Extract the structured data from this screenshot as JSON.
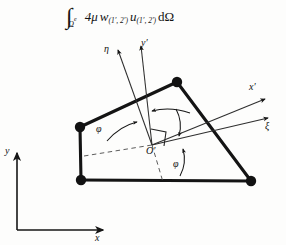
{
  "figure": {
    "formula": {
      "integral_symbol": "∫",
      "integral_subscript": "Ω",
      "integral_superscript": "e",
      "coefficient": "4μ",
      "weight_symbol": "w",
      "weight_subscript": "(1′, 2′)",
      "field_symbol": "u",
      "field_subscript": "(1′, 2′)",
      "measure": "dΩ"
    },
    "global_axes": {
      "x_label": "x",
      "y_label": "y"
    },
    "local_axes": {
      "eta_label": "η",
      "y_prime_label": "y′",
      "x_prime_label": "x′",
      "xi_label": "ξ"
    },
    "origin_label": "O′",
    "angles": [
      {
        "name": "phi-upper-left",
        "label": "φ"
      },
      {
        "name": "phi-lower-right",
        "label": "φ"
      }
    ],
    "right_angle_marker": "90°",
    "element": {
      "type": "quadrilateral-finite-element",
      "node_count": 5,
      "nodes": [
        {
          "id": "node-top",
          "x": 177,
          "y": 82
        },
        {
          "id": "node-mid-left",
          "x": 80,
          "y": 127
        },
        {
          "id": "node-bottom-left",
          "x": 81,
          "y": 180
        },
        {
          "id": "node-bottom-right",
          "x": 251,
          "y": 181
        },
        {
          "id": "node-edge-vertex",
          "x": 138,
          "y": 108
        }
      ]
    },
    "colors": {
      "ink": "#141414",
      "background": "#fdfdfc",
      "thin_line": "#3a3a3a"
    }
  }
}
